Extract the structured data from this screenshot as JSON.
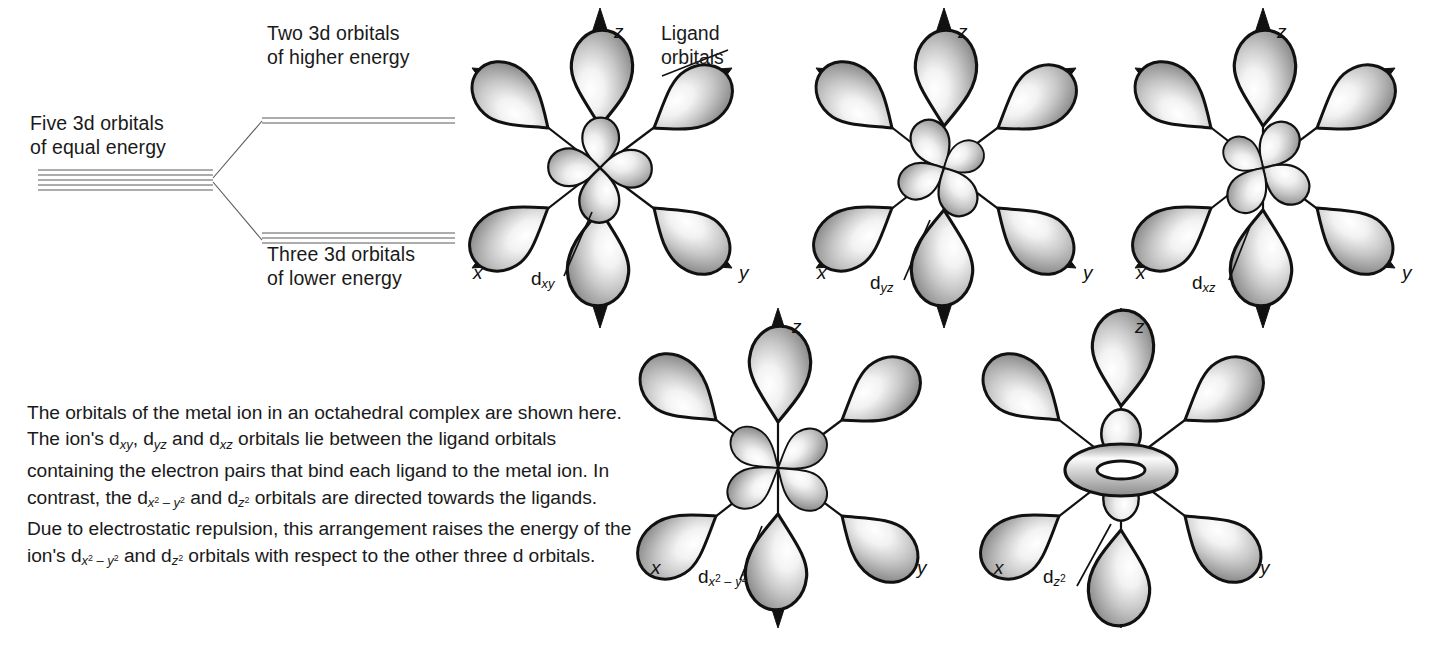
{
  "figure": {
    "background_color": "#ffffff",
    "line_color": "#1a1a1a",
    "lobe_fill_light": "#ffffff",
    "lobe_fill_dark": "#8c8c8c"
  },
  "energy_diagram": {
    "left_label": "Five 3d orbitals\nof equal energy",
    "upper_label": "Two 3d orbitals\nof higher energy",
    "lower_label": "Three 3d orbitals\nof lower energy",
    "left_line_count": 5,
    "upper_line_count": 2,
    "lower_line_count": 3
  },
  "callouts": {
    "ligand_orbitals": "Ligand\norbitals"
  },
  "paragraph": {
    "text_plain": "The orbitals of the metal ion in an octahedral complex are shown here.  The ion's dxy, dyz and dxz orbitals lie between the ligand orbitals containing the electron pairs that bind each ligand to the metal ion.  In contrast, the dx2 – y2 and dz2 orbitals are directed towards the ligands.  Due to electrostatic repulsion, this arrangement raises the energy of the ion's dx2 – y2 and dz2 orbitals with respect to the other three d orbitals.",
    "seg1": "The orbitals of the metal ion in an octahedral complex are shown here.  The ion's d",
    "sub1": "xy",
    "seg2": ", d",
    "sub2": "yz",
    "seg3": " and d",
    "sub3": "xz",
    "seg4": " orbitals lie between the ligand orbitals containing the electron pairs that bind each ligand to the metal ion.  In contrast, the d",
    "seg5": " and d",
    "seg6": " orbitals are directed towards the ligands.  Due to electrostatic repulsion, this arrangement raises the energy of the ion's d",
    "seg7": " and d",
    "seg8": " orbitals with respect to the other three d orbitals."
  },
  "orbitals": [
    {
      "id": "dxy",
      "label_main": "d",
      "label_sub": "xy",
      "axes": {
        "z": "z",
        "x": "x",
        "y": "y"
      },
      "ligand_count": 6,
      "center_lobe_type": "cloverleaf-between-axes",
      "center_lobe_count": 4,
      "energy_group": "lower",
      "position": {
        "cx": 592,
        "cy": 170
      }
    },
    {
      "id": "dyz",
      "label_main": "d",
      "label_sub": "yz",
      "axes": {
        "z": "z",
        "x": "x",
        "y": "y"
      },
      "ligand_count": 6,
      "center_lobe_type": "cloverleaf-between-axes",
      "center_lobe_count": 4,
      "energy_group": "lower",
      "position": {
        "cx": 936,
        "cy": 170
      }
    },
    {
      "id": "dxz",
      "label_main": "d",
      "label_sub": "xz",
      "axes": {
        "z": "z",
        "x": "x",
        "y": "y"
      },
      "ligand_count": 6,
      "center_lobe_type": "cloverleaf-between-axes",
      "center_lobe_count": 4,
      "energy_group": "lower",
      "position": {
        "cx": 1255,
        "cy": 170
      }
    },
    {
      "id": "dx2-y2",
      "label_main": "d",
      "label_sub_x": "x",
      "label_sup_x": "2",
      "label_minus": " – ",
      "label_sub_y": "y",
      "label_sup_y": "2",
      "axes": {
        "z": "z",
        "x": "x",
        "y": "y"
      },
      "ligand_count": 6,
      "center_lobe_type": "cloverleaf-along-axes",
      "center_lobe_count": 4,
      "energy_group": "higher",
      "position": {
        "cx": 770,
        "cy": 465
      }
    },
    {
      "id": "dz2",
      "label_main": "d",
      "label_sub_z": "z",
      "label_sup_z": "2",
      "axes": {
        "z": "z",
        "x": "x",
        "y": "y"
      },
      "ligand_count": 6,
      "center_lobe_type": "dumbbell-with-torus",
      "center_lobe_count": 2,
      "has_torus": true,
      "energy_group": "higher",
      "position": {
        "cx": 1113,
        "cy": 465
      }
    }
  ]
}
